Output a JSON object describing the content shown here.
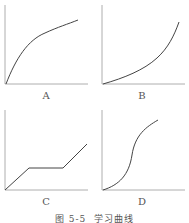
{
  "figure": {
    "caption": "图 5-5  学习曲线",
    "panels": [
      {
        "label": "A",
        "curve": "concave increasing (negatively accelerated)"
      },
      {
        "label": "B",
        "curve": "convex increasing (positively accelerated)"
      },
      {
        "label": "C",
        "curve": "rise, plateau, rise"
      },
      {
        "label": "D",
        "curve": "S-shaped"
      }
    ]
  }
}
